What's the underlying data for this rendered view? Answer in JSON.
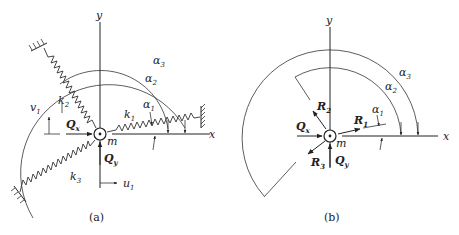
{
  "figure_a": {
    "caption": "(a)",
    "axis_x": "x",
    "axis_y": "y",
    "mass": "m",
    "springs": [
      {
        "label": "k",
        "sub": "1"
      },
      {
        "label": "k",
        "sub": "2"
      },
      {
        "label": "k",
        "sub": "3"
      }
    ],
    "angles": [
      {
        "label": "α",
        "sub": "1"
      },
      {
        "label": "α",
        "sub": "2"
      },
      {
        "label": "α",
        "sub": "3"
      }
    ],
    "forces": {
      "qx": {
        "label": "Q",
        "sub": "x"
      },
      "qy": {
        "label": "Q",
        "sub": "y"
      }
    },
    "displacements": {
      "u": {
        "label": "u",
        "sub": "1"
      },
      "v": {
        "label": "v",
        "sub": "1"
      }
    }
  },
  "figure_b": {
    "caption": "(b)",
    "axis_x": "x",
    "axis_y": "y",
    "mass": "m",
    "reactions": [
      {
        "label": "R",
        "sub": "1"
      },
      {
        "label": "R",
        "sub": "2"
      },
      {
        "label": "R",
        "sub": "3"
      }
    ],
    "angles": [
      {
        "label": "α",
        "sub": "1"
      },
      {
        "label": "α",
        "sub": "2"
      },
      {
        "label": "α",
        "sub": "3"
      }
    ],
    "forces": {
      "qx": {
        "label": "Q",
        "sub": "x"
      },
      "qy": {
        "label": "Q",
        "sub": "y"
      }
    }
  }
}
